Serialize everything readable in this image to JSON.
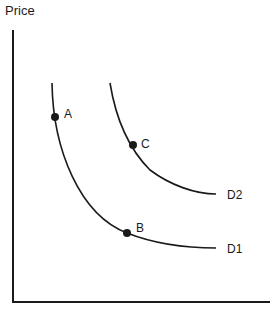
{
  "diagram": {
    "y_axis_label": "Price",
    "x_axis_label": "",
    "curves": [
      {
        "name": "D1",
        "label": "D1"
      },
      {
        "name": "D2",
        "label": "D2"
      }
    ],
    "points": [
      {
        "label": "A",
        "curve": "D1"
      },
      {
        "label": "B",
        "curve": "D1"
      },
      {
        "label": "C",
        "curve": "D2"
      }
    ],
    "colors": {
      "line": "#1a1a1a",
      "background": "#ffffff"
    }
  }
}
